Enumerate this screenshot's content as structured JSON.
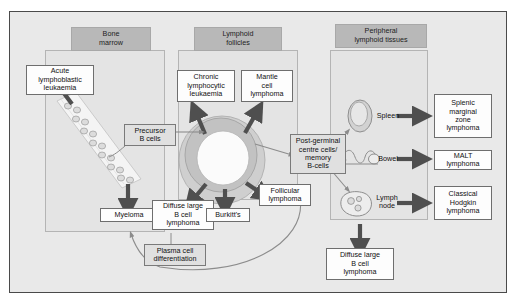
{
  "figure": {
    "background": "#e9e9e9",
    "frame_color": "#4a4a4a"
  },
  "columns": [
    {
      "key": "bone_marrow",
      "header": "Bone\nmarrow"
    },
    {
      "key": "lymphoid_follicles",
      "header": "Lymphoid\nfollicles"
    },
    {
      "key": "peripheral",
      "header": "Peripheral\nlymphoid tissues"
    }
  ],
  "disease_boxes": [
    {
      "key": "all",
      "label": "Acute\nlymphoblastic\nleukaemia"
    },
    {
      "key": "myeloma",
      "label": "Myeloma"
    },
    {
      "key": "cll",
      "label": "Chronic\nlymphocytic\nleukaemia"
    },
    {
      "key": "mantle",
      "label": "Mantle\ncell\nlymphoma"
    },
    {
      "key": "dlbcl_follicle",
      "label": "Diffuse large\nB cell\nlymphoma"
    },
    {
      "key": "burkitts",
      "label": "Burkitt's"
    },
    {
      "key": "follicular",
      "label": "Follicular\nlymphoma"
    },
    {
      "key": "splenic",
      "label": "Splenic\nmarginal\nzone\nlymphoma"
    },
    {
      "key": "malt",
      "label": "MALT\nlymphoma"
    },
    {
      "key": "hodgkin",
      "label": "Classical\nHodgkin\nlymphoma"
    },
    {
      "key": "dlbcl_node",
      "label": "Diffuse large\nB cell\nlymphoma"
    }
  ],
  "stage_labels": [
    {
      "key": "precursor",
      "label": "Precursor\nB cells"
    },
    {
      "key": "postgerminal",
      "label": "Post-germinal\ncentre cells/\nmemory\nB-cells"
    },
    {
      "key": "plasma",
      "label": "Plasma cell\ndifferentiation"
    }
  ],
  "organs": [
    {
      "key": "spleen",
      "label": "Spleen",
      "icon": "spleen-icon"
    },
    {
      "key": "bowel",
      "label": "Bowel",
      "icon": "bowel-icon"
    },
    {
      "key": "lymph_node",
      "label": "Lymph\nnode",
      "icon": "lymph-node-icon"
    }
  ],
  "graphics": {
    "germinal_centre": "germinal-centre-icon",
    "marrow_band": "bone-marrow-band-icon",
    "arrow_thick_color": "#4f4f4f",
    "arrow_thin_color": "#8c8c8c",
    "cell_fill": "#dcdcdc",
    "cell_stroke": "#9a9a9a"
  }
}
